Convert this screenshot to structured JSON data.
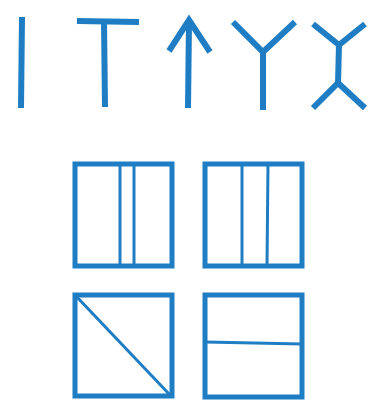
{
  "diagram": {
    "stroke_color": "#1f7dc4",
    "background": "#ffffff",
    "symbols_row": [
      {
        "id": "symbol-i",
        "shape": "vertical-line"
      },
      {
        "id": "symbol-t",
        "shape": "t-shape"
      },
      {
        "id": "symbol-arrow",
        "shape": "up-arrow"
      },
      {
        "id": "symbol-y",
        "shape": "y-shape"
      },
      {
        "id": "symbol-x",
        "shape": "double-y-shape"
      }
    ],
    "boxes": [
      {
        "id": "box-two-close-verticals",
        "division": "two vertical lines, close together"
      },
      {
        "id": "box-two-spread-verticals",
        "division": "two vertical lines, evenly spread"
      },
      {
        "id": "box-diagonal",
        "division": "diagonal line top-left to bottom-right"
      },
      {
        "id": "box-horizontal",
        "division": "one horizontal line"
      }
    ]
  }
}
